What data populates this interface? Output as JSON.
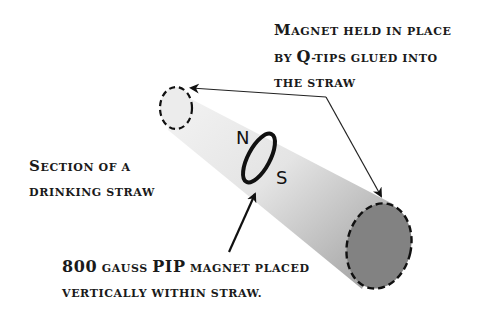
{
  "labels": {
    "qtips": {
      "line1_cap": "M",
      "line1_rest": "agnet held in place",
      "line2_pre": "by ",
      "line2_big": "Q",
      "line2_rest": "-tips glued into",
      "line3": "the straw"
    },
    "straw": {
      "line1_cap": "S",
      "line1_rest": "ection of a",
      "line2": "drinking straw"
    },
    "magnet": {
      "line1_num": "800",
      "line1_mid": " gauss ",
      "line1_big": "PIP",
      "line1_rest": " magnet placed",
      "line2": "vertically within straw."
    }
  },
  "poles": {
    "north": "N",
    "south": "S"
  },
  "colors": {
    "tube_light": "#f2f2f2",
    "tube_dark": "#9a9a9a",
    "end_cap": "#7e7e7e",
    "ink": "#111111"
  }
}
